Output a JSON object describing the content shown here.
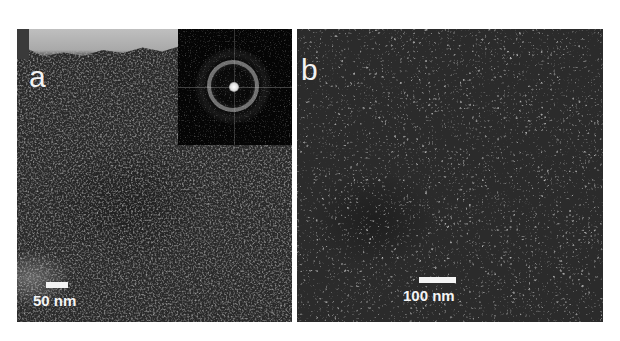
{
  "figure": {
    "background_color": "#ffffff",
    "panels": [
      {
        "id": "a",
        "label": "a",
        "scale_bar": {
          "label": "50 nm",
          "length_px": 22
        },
        "inset": {
          "type": "FFT / diffraction pattern",
          "features": [
            "bright center spot",
            "diffuse ring",
            "faint cross lines"
          ]
        },
        "content": "dense porous nanoparticle texture with lighter edge region at top",
        "text_color": "#f2f2f2"
      },
      {
        "id": "b",
        "label": "b",
        "scale_bar": {
          "label": "100 nm",
          "length_px": 37
        },
        "content": "uniform worm-like porous texture",
        "text_color": "#f2f2f2"
      }
    ]
  }
}
